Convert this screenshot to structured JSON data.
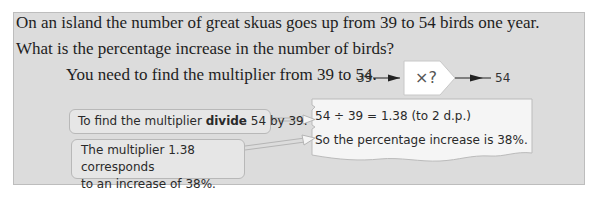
{
  "question": {
    "line1": "On an island the number of great skuas goes up from 39 to 54 birds one year.",
    "line2": "What is the percentage increase in the number of birds?"
  },
  "hint": "You need to find the multiplier from 39 to 54.",
  "flow": {
    "start": "39",
    "operation": "×?",
    "end": "54"
  },
  "callouts": {
    "divide": {
      "before": "To find the multiplier ",
      "bold": "divide",
      "after": " 54 by 39."
    },
    "multiplier": {
      "line1": "The multiplier 1.38 corresponds",
      "line2": "to an increase of 38%."
    }
  },
  "working": {
    "line1": "54 ÷ 39 = 1.38 (to 2 d.p.)",
    "line2": "So the percentage increase is 38%."
  },
  "colors": {
    "panel_bg": "#dcdcdc",
    "note_bg": "#f7f7f7",
    "callout_bg": "#e6e6e6"
  }
}
